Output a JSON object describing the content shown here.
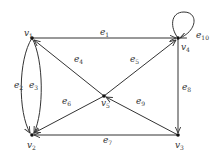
{
  "graph": {
    "type": "directed multigraph",
    "vertices": [
      {
        "id": "v1",
        "label": "v",
        "sub": "1",
        "x": 32,
        "y": 38
      },
      {
        "id": "v2",
        "label": "v",
        "sub": "2",
        "x": 32,
        "y": 135
      },
      {
        "id": "v3",
        "label": "v",
        "sub": "3",
        "x": 178,
        "y": 135
      },
      {
        "id": "v4",
        "label": "v",
        "sub": "4",
        "x": 178,
        "y": 38
      },
      {
        "id": "v5",
        "label": "v",
        "sub": "5",
        "x": 104,
        "y": 96
      }
    ],
    "edges": [
      {
        "id": "e1",
        "label": "e",
        "sub": "1",
        "from": "v1",
        "to": "v4"
      },
      {
        "id": "e2",
        "label": "e",
        "sub": "2",
        "from": "v1",
        "to": "v2"
      },
      {
        "id": "e3",
        "label": "e",
        "sub": "3",
        "from": "v1",
        "to": "v2"
      },
      {
        "id": "e4",
        "label": "e",
        "sub": "4",
        "from": "v5",
        "to": "v1"
      },
      {
        "id": "e5",
        "label": "e",
        "sub": "5",
        "from": "v5",
        "to": "v4"
      },
      {
        "id": "e6",
        "label": "e",
        "sub": "6",
        "from": "v5",
        "to": "v2"
      },
      {
        "id": "e7",
        "label": "e",
        "sub": "7",
        "from": "v3",
        "to": "v2"
      },
      {
        "id": "e8",
        "label": "e",
        "sub": "8",
        "from": "v4",
        "to": "v3"
      },
      {
        "id": "e9",
        "label": "e",
        "sub": "9",
        "from": "v3",
        "to": "v5"
      },
      {
        "id": "e10",
        "label": "e",
        "sub": "10",
        "from": "v4",
        "to": "v4"
      }
    ]
  }
}
